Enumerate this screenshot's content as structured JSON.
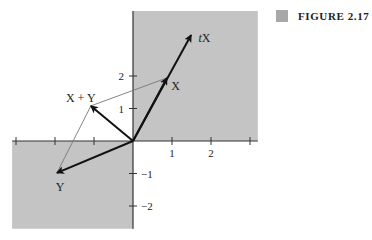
{
  "caption": {
    "label": "FIGURE 2.17",
    "marker_color": "#a8a8a8"
  },
  "colors": {
    "shade": "#c4c4c4",
    "axis": "#333333",
    "vector": "#111111",
    "thin_line": "#777777",
    "text": "#222222"
  },
  "plot": {
    "origin_px": [
      133,
      141
    ],
    "unit_px": [
      39,
      32.5
    ],
    "shaded_regions": [
      {
        "name": "first-quadrant",
        "x": [
          0,
          3.2
        ],
        "y": [
          0,
          4.0
        ]
      },
      {
        "name": "third-quadrant",
        "x": [
          -3.1,
          0
        ],
        "y": [
          -2.7,
          0
        ]
      }
    ],
    "x_ticks": [
      -3,
      -2,
      -1,
      1,
      2,
      3
    ],
    "x_tick_labels": [
      {
        "value": 1,
        "label": "1"
      },
      {
        "value": 2,
        "label": "2"
      }
    ],
    "y_ticks": [
      -2,
      -1,
      1,
      2
    ],
    "y_tick_labels": [
      {
        "value": 2,
        "label": "2",
        "side": "left"
      },
      {
        "value": 1,
        "label": "1",
        "side": "left"
      },
      {
        "value": -1,
        "label": "−1",
        "side": "right"
      },
      {
        "value": -2,
        "label": "−2",
        "side": "right"
      }
    ]
  },
  "chart_data": {
    "type": "vector-diagram",
    "title": "FIGURE 2.17",
    "xlim": [
      -3.1,
      3.2
    ],
    "ylim": [
      -2.7,
      4.0
    ],
    "vectors": [
      {
        "name": "tX",
        "label": "tX",
        "from": [
          0,
          0
        ],
        "to": [
          1.49,
          3.26
        ],
        "style": "bold"
      },
      {
        "name": "X",
        "label": "X",
        "from": [
          0,
          0
        ],
        "to": [
          0.87,
          1.94
        ],
        "style": "bold"
      },
      {
        "name": "Y",
        "label": "Y",
        "from": [
          0,
          0
        ],
        "to": [
          -1.95,
          -0.98
        ],
        "style": "bold"
      },
      {
        "name": "X+Y",
        "label": "X + Y",
        "from": [
          0,
          0
        ],
        "to": [
          -1.08,
          1.08
        ],
        "style": "bold"
      }
    ],
    "parallelogram_edges": [
      {
        "from": [
          0.87,
          1.94
        ],
        "to": [
          -1.08,
          1.08
        ]
      },
      {
        "from": [
          -1.95,
          -0.98
        ],
        "to": [
          -1.08,
          1.08
        ]
      }
    ],
    "labels": [
      {
        "text": "tX",
        "at": [
          1.68,
          3.17
        ]
      },
      {
        "text": "X",
        "at": [
          0.98,
          1.68
        ]
      },
      {
        "text": "X + Y",
        "at": [
          -1.72,
          1.32
        ]
      },
      {
        "text": "Y",
        "at": [
          -1.98,
          -1.42
        ]
      }
    ]
  }
}
